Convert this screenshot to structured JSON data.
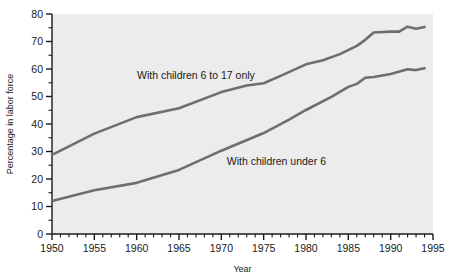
{
  "chart_data": {
    "type": "line",
    "title": "",
    "xlabel": "Year",
    "ylabel": "Percentage in labor force",
    "xlim": [
      1950,
      1995
    ],
    "ylim": [
      0,
      80
    ],
    "grid": false,
    "legend_position": "inline-annotations",
    "x_ticks": [
      1950,
      1955,
      1960,
      1965,
      1970,
      1975,
      1980,
      1985,
      1990,
      1995
    ],
    "x_tick_labels": [
      "1950",
      "1955",
      "1960",
      "1965",
      "1970",
      "1975",
      "1980",
      "1985",
      "1990",
      "1995"
    ],
    "x_minor_tick_step": 1,
    "y_ticks": [
      0,
      10,
      20,
      30,
      40,
      50,
      60,
      70,
      80
    ],
    "y_tick_labels": [
      "0",
      "10",
      "20",
      "30",
      "40",
      "50",
      "60",
      "70",
      "80"
    ],
    "y_minor_tick_step": 5,
    "plot_background": "#ececec",
    "line_color": "#6e6e6e",
    "series": [
      {
        "name": "With children 6 to 17 only",
        "label_x": 1967.0,
        "label_y": 56.5,
        "color": "#6e6e6e",
        "x": [
          1950,
          1955,
          1960,
          1965,
          1970,
          1973,
          1975,
          1977,
          1980,
          1982,
          1984,
          1986,
          1987,
          1988,
          1990,
          1991,
          1992,
          1993,
          1994
        ],
        "values": [
          28.8,
          36.5,
          42.5,
          45.7,
          51.6,
          54.0,
          54.8,
          57.5,
          61.7,
          63.2,
          65.4,
          68.4,
          70.6,
          73.3,
          73.6,
          73.6,
          75.4,
          74.6,
          75.3
        ]
      },
      {
        "name": "With children under 6",
        "label_x": 1976.5,
        "label_y": 25.0,
        "color": "#6e6e6e",
        "x": [
          1950,
          1955,
          1960,
          1965,
          1970,
          1975,
          1978,
          1980,
          1983,
          1985,
          1986,
          1987,
          1988,
          1990,
          1992,
          1993,
          1994
        ],
        "values": [
          12.0,
          15.9,
          18.6,
          23.3,
          30.3,
          36.7,
          41.6,
          45.1,
          49.9,
          53.5,
          54.6,
          56.8,
          57.1,
          58.2,
          59.9,
          59.6,
          60.3
        ]
      }
    ]
  }
}
